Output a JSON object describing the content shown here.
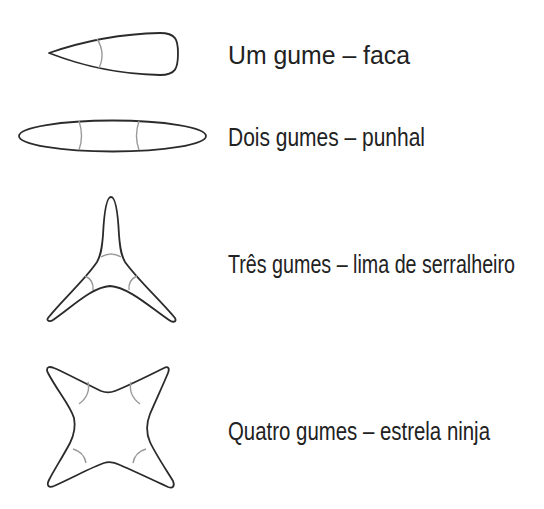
{
  "diagram": {
    "items": [
      {
        "shape": "knife-cross-section",
        "label": "Um gume – faca",
        "label_width": 182
      },
      {
        "shape": "dagger-cross-section",
        "label": "Dois gumes – punhal",
        "label_width": 197
      },
      {
        "shape": "file-cross-section",
        "label": "Três gumes – lima de serralheiro",
        "label_width": 287
      },
      {
        "shape": "ninja-star-cross-section",
        "label": "Quatro gumes – estrela ninja",
        "label_width": 262
      }
    ],
    "colors": {
      "outline": "#2b2b2b",
      "edge_arc": "#9a9a9a",
      "text": "#222222",
      "background": "#ffffff"
    }
  }
}
